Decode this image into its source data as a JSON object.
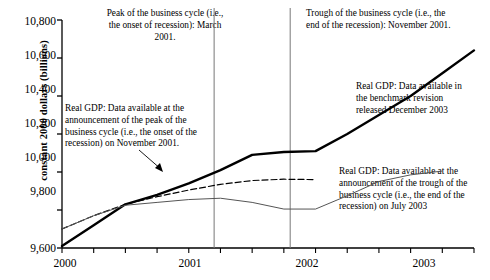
{
  "chart_data": {
    "type": "line",
    "title": "",
    "xlabel": "",
    "ylabel": "constant 2000 dollars (billions)",
    "ylim": [
      9600,
      10800
    ],
    "xlim": [
      2000.0,
      2003.25
    ],
    "grid": false,
    "legend_position": "inline-annotations",
    "y_ticks": [
      "9,600",
      "9,800",
      "10,000",
      "10,200",
      "10,400",
      "10,600",
      "10,800"
    ],
    "y_tick_values": [
      9600,
      9800,
      10000,
      10200,
      10400,
      10600,
      10800
    ],
    "x_ticks": [
      "2000",
      "2001",
      "2002",
      "2003"
    ],
    "x_tick_values": [
      2000,
      2001,
      2002,
      2003
    ],
    "x_minor_tick_values": [
      2000.25,
      2000.5,
      2000.75,
      2001.25,
      2001.5,
      2001.75,
      2002.25,
      2002.5,
      2002.75,
      2003.25
    ],
    "series": [
      {
        "name": "Real GDP: Data available in the benchmark revision released December 2003",
        "style": "thick-solid",
        "color": "#000000",
        "x": [
          2000.0,
          2000.25,
          2000.5,
          2000.75,
          2001.0,
          2001.25,
          2001.5,
          2001.75,
          2002.0,
          2002.25,
          2002.5,
          2002.75,
          2003.0,
          2003.25
        ],
        "y": [
          9610,
          9720,
          9830,
          9880,
          9940,
          10010,
          10090,
          10105,
          10110,
          10200,
          10300,
          10400,
          10520,
          10640
        ]
      },
      {
        "name": "Real GDP: Data available at the announcement of the peak of the business cycle (i.e., the onset of the recession) on November 2001.",
        "style": "dashed",
        "color": "#000000",
        "x": [
          2000.0,
          2000.25,
          2000.5,
          2000.75,
          2001.0,
          2001.25,
          2001.5,
          2001.75,
          2002.0
        ],
        "y": [
          9700,
          9770,
          9830,
          9870,
          9905,
          9935,
          9955,
          9962,
          9960
        ]
      },
      {
        "name": "Real GDP: Data available at the announcement of the trough of the business cycle (i.e., the end of the recession) on July 2003",
        "style": "thin-solid",
        "color": "#555555",
        "x": [
          2000.0,
          2000.25,
          2000.5,
          2000.75,
          2001.0,
          2001.25,
          2001.5,
          2001.75,
          2002.0,
          2002.25,
          2002.5,
          2002.75,
          2003.0
        ],
        "y": [
          9700,
          9770,
          9825,
          9840,
          9855,
          9862,
          9840,
          9805,
          9805,
          9875,
          9950,
          9985,
          10005
        ]
      }
    ],
    "event_lines": [
      {
        "name": "peak-of-business-cycle",
        "x": 2001.2,
        "label": "Peak of the business cycle (i.e., the onset of recession):  March 2001."
      },
      {
        "name": "trough-of-business-cycle",
        "x": 2001.8,
        "label": "Trough of the business cycle (i.e., the end of the recession):  November 2001."
      }
    ],
    "annotations": [
      {
        "name": "peak-annotation",
        "text": "Peak of the business cycle (i.e., the onset of recession):  March 2001."
      },
      {
        "name": "trough-annotation",
        "text": "Trough of the business cycle (i.e., the end of the recession):  November 2001."
      },
      {
        "name": "nov-2001-vintage-annotation",
        "text": "Real GDP: Data available at the announcement of the peak of the business cycle (i.e., the onset of the recession) on November 2001."
      },
      {
        "name": "benchmark-revision-annotation",
        "text": "Real GDP: Data available in the benchmark revision released December 2003"
      },
      {
        "name": "july-2003-vintage-annotation",
        "text": "Real GDP: Data available at the announcement of the trough of the business cycle (i.e., the end of the recession) on July 2003"
      }
    ]
  },
  "axis": {
    "y_label": "constant 2000 dollars (billions)",
    "y_ticks": [
      "10,800",
      "10,600",
      "10,400",
      "10,200",
      "10,000",
      "9,800",
      "9,600"
    ],
    "x_ticks": [
      "2000",
      "2001",
      "2002",
      "2003"
    ]
  },
  "annotations": {
    "peak": "Peak of the business cycle (i.e., the onset of recession):  March 2001.",
    "trough": "Trough of the business cycle (i.e., the end of the recession):  November 2001.",
    "nov2001": "Real GDP: Data available at the announcement of the peak of the business cycle (i.e., the onset of the recession) on November 2001.",
    "benchmark": "Real GDP: Data available in the benchmark revision released December 2003",
    "july2003": "Real GDP: Data available at the announcement of the trough of the business cycle (i.e., the end of the recession) on July 2003"
  },
  "colors": {
    "axis": "#000000",
    "benchmark_series": "#000000",
    "nov2001_series": "#000000",
    "july2003_series": "#555555",
    "event_line": "#777777",
    "background": "#ffffff"
  }
}
